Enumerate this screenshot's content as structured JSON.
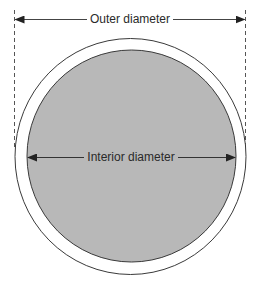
{
  "figure": {
    "outer_label": "Outer diameter",
    "inner_label": "Interior diameter"
  },
  "colors": {
    "background": "#ffffff",
    "interior_fill": "#b8b8b8",
    "stroke": "#3a3a3a",
    "text": "#2a2a2a"
  }
}
